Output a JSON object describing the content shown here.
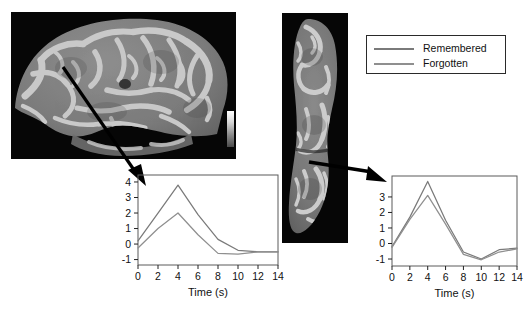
{
  "figure": {
    "background": "#ffffff",
    "panels": [
      {
        "name": "brain-lateral",
        "view": "lateral cortical surface rendering",
        "modality": "fMRI activation on inflated/smoothed brain surface"
      },
      {
        "name": "brain-ventral",
        "view": "ventral cortical surface rendering",
        "modality": "fMRI activation on inflated/smoothed brain surface"
      }
    ]
  },
  "legend": {
    "position": "top-right",
    "entries": [
      {
        "label": "Remembered",
        "color": "#7a7a7a"
      },
      {
        "label": "Forgotten",
        "color": "#8f8f8f"
      }
    ]
  },
  "chart_data": [
    {
      "id": "left-timecourse",
      "type": "line",
      "title": "",
      "xlabel": "Time (s)",
      "ylabel": "",
      "x": [
        0,
        2,
        4,
        6,
        8,
        10,
        12,
        14
      ],
      "xticks": [
        0,
        2,
        4,
        6,
        8,
        10,
        12,
        14
      ],
      "xticklabels": [
        "0",
        "2",
        "4",
        "6",
        "8",
        "10",
        "12",
        "14"
      ],
      "yticks": [
        -1,
        0,
        1,
        2,
        3,
        4
      ],
      "yticklabels": [
        "-1",
        "0",
        "1",
        "2",
        "3",
        "4"
      ],
      "xlim": [
        0,
        14
      ],
      "ylim": [
        -1.35,
        4.45
      ],
      "grid": false,
      "series": [
        {
          "name": "Remembered",
          "color": "#7a7a7a",
          "values": [
            0.2,
            2.0,
            3.8,
            1.9,
            0.3,
            -0.4,
            -0.5,
            -0.5
          ]
        },
        {
          "name": "Forgotten",
          "color": "#8f8f8f",
          "values": [
            -0.25,
            1.0,
            2.0,
            0.6,
            -0.6,
            -0.65,
            -0.5,
            -0.5
          ]
        }
      ]
    },
    {
      "id": "right-timecourse",
      "type": "line",
      "title": "",
      "xlabel": "Time (s)",
      "ylabel": "",
      "x": [
        0,
        2,
        4,
        6,
        8,
        10,
        12,
        14
      ],
      "xticks": [
        0,
        2,
        4,
        6,
        8,
        10,
        12,
        14
      ],
      "xticklabels": [
        "0",
        "2",
        "4",
        "6",
        "8",
        "10",
        "12",
        "14"
      ],
      "yticks": [
        -1,
        0,
        1,
        2,
        3
      ],
      "yticklabels": [
        "-1",
        "0",
        "1",
        "2",
        "3"
      ],
      "xlim": [
        0,
        14
      ],
      "ylim": [
        -1.45,
        4.35
      ],
      "grid": false,
      "series": [
        {
          "name": "Remembered",
          "color": "#7a7a7a",
          "values": [
            -0.2,
            1.7,
            4.0,
            1.5,
            -0.55,
            -1.0,
            -0.4,
            -0.3
          ]
        },
        {
          "name": "Forgotten",
          "color": "#8f8f8f",
          "values": [
            -0.25,
            1.55,
            3.1,
            1.25,
            -0.7,
            -1.05,
            -0.55,
            -0.35
          ]
        }
      ]
    }
  ],
  "annotations": {
    "arrows": [
      {
        "name": "arrow-lateral-to-left-chart",
        "from": "brain-lateral activation focus",
        "to": "left-timecourse"
      },
      {
        "name": "arrow-ventral-to-right-chart",
        "from": "brain-ventral activation focus",
        "to": "right-timecourse"
      }
    ]
  }
}
